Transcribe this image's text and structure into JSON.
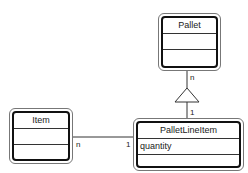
{
  "diagram": {
    "type": "uml-class",
    "classes": [
      {
        "id": "pallet",
        "name": "Pallet",
        "attributes": "",
        "operations": ""
      },
      {
        "id": "item",
        "name": "Item",
        "attributes": "",
        "operations": ""
      },
      {
        "id": "palletlineitem",
        "name": "PalletLineItem",
        "attributes": "quantity",
        "operations": ""
      }
    ],
    "relationships": [
      {
        "from": "Pallet",
        "to": "PalletLineItem",
        "kind": "aggregation/inheritance-triangle",
        "from_multiplicity": "n",
        "to_multiplicity": "1"
      },
      {
        "from": "Item",
        "to": "PalletLineItem",
        "kind": "association",
        "from_multiplicity": "n",
        "to_multiplicity": "1"
      }
    ],
    "labels": {
      "pallet_end": "n",
      "pli_top_end": "1",
      "item_end": "n",
      "pli_left_end": "1"
    },
    "colors": {
      "line": "#333333",
      "border": "#111111",
      "background": "#ffffff"
    }
  }
}
